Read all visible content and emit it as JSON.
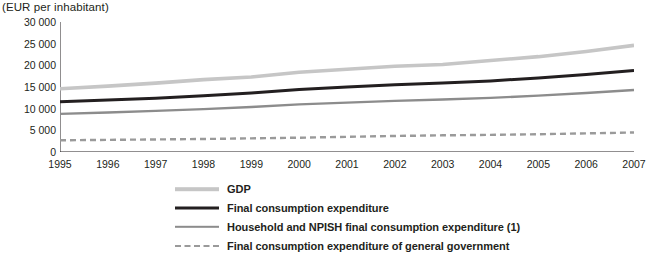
{
  "chart": {
    "unit_label": "(EUR per inhabitant)",
    "y_ticks": [
      "0",
      "5 000",
      "10 000",
      "15 000",
      "20 000",
      "25 000",
      "30 000"
    ],
    "x_ticks": [
      "1995",
      "1996",
      "1997",
      "1998",
      "1999",
      "2000",
      "2001",
      "2002",
      "2003",
      "2004",
      "2005",
      "2006",
      "2007"
    ]
  },
  "legend": {
    "items": [
      {
        "label": "GDP",
        "color": "#c6c6c6",
        "width": 3.6,
        "dashed": false
      },
      {
        "label": "Final consumption expenditure",
        "color": "#231f20",
        "width": 3.0,
        "dashed": false
      },
      {
        "label": "Household and NPISH final consumption expenditure (1)",
        "color": "#8c8c8c",
        "width": 2.4,
        "dashed": false
      },
      {
        "label": "Final consumption expenditure of general government",
        "color": "#9a9a9a",
        "width": 2.4,
        "dashed": true
      }
    ]
  },
  "chart_data": {
    "type": "line",
    "title": "",
    "subtitle": "",
    "xlabel": "",
    "ylabel": "(EUR per inhabitant)",
    "x": [
      1995,
      1996,
      1997,
      1998,
      1999,
      2000,
      2001,
      2002,
      2003,
      2004,
      2005,
      2006,
      2007
    ],
    "xlim": [
      1995,
      2007
    ],
    "ylim": [
      0,
      30000
    ],
    "yticks": [
      0,
      5000,
      10000,
      15000,
      20000,
      25000,
      30000
    ],
    "grid": false,
    "legend_position": "bottom",
    "series": [
      {
        "name": "GDP",
        "color": "#c6c6c6",
        "style": "solid",
        "values": [
          14600,
          15200,
          15900,
          16700,
          17300,
          18400,
          19100,
          19800,
          20200,
          21100,
          22000,
          23200,
          24600
        ]
      },
      {
        "name": "Final consumption expenditure",
        "color": "#231f20",
        "style": "solid",
        "values": [
          11600,
          12000,
          12400,
          13000,
          13600,
          14400,
          15000,
          15500,
          15900,
          16400,
          17100,
          17900,
          18800
        ]
      },
      {
        "name": "Household and NPISH final consumption expenditure (1)",
        "color": "#8c8c8c",
        "style": "solid",
        "values": [
          8800,
          9100,
          9500,
          9900,
          10400,
          11000,
          11400,
          11800,
          12100,
          12500,
          13000,
          13600,
          14300
        ]
      },
      {
        "name": "Final consumption expenditure of general government",
        "color": "#9a9a9a",
        "style": "dashed",
        "values": [
          2700,
          2800,
          2900,
          3000,
          3150,
          3300,
          3500,
          3700,
          3850,
          3950,
          4100,
          4300,
          4500
        ]
      }
    ]
  }
}
